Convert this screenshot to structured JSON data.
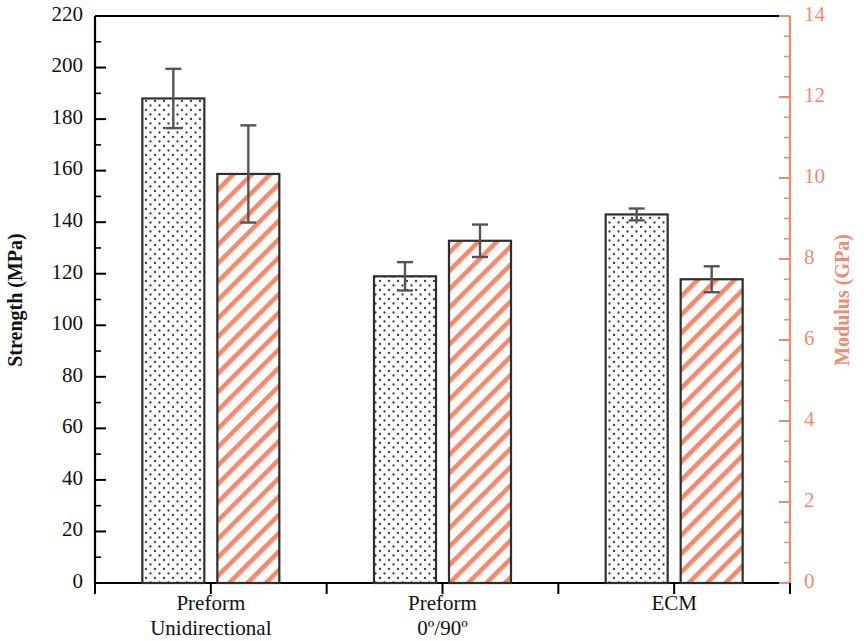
{
  "chart_data": {
    "type": "bar",
    "title": "",
    "subtitle": "",
    "categories": [
      "Preform Unidirectional",
      "Preform 0º/90º",
      "ECM"
    ],
    "category_lines": [
      [
        "Preform",
        "Unidirectional"
      ],
      [
        "Preform",
        "0º/90º"
      ],
      [
        "ECM",
        ""
      ]
    ],
    "series": [
      {
        "name": "Strength (MPa)",
        "axis": "left",
        "pattern": "dotted",
        "values": [
          188,
          119,
          143
        ],
        "errors": [
          11.5,
          5.5,
          2.3
        ],
        "color": "#000000",
        "fill": "#ffffff"
      },
      {
        "name": "Modulus (GPa)",
        "axis": "right",
        "pattern": "diagonal-hatch",
        "values": [
          10.1,
          8.45,
          7.5
        ],
        "errors": [
          1.2,
          0.4,
          0.32
        ],
        "color": "#ef8b70",
        "fill": "#fffaf6"
      }
    ],
    "left_axis": {
      "label": "Strength (MPa)",
      "ticks": [
        0,
        20,
        40,
        60,
        80,
        100,
        120,
        140,
        160,
        180,
        200,
        220
      ],
      "tick_labels": [
        "0",
        "20",
        "40",
        "60",
        "80",
        "100",
        "120",
        "140",
        "160",
        "180",
        "200",
        "220"
      ],
      "ylim": [
        0,
        220
      ],
      "minor_ticks_per_major": 2,
      "color": "#000000"
    },
    "right_axis": {
      "label": "Modulus (GPa)",
      "ticks": [
        0,
        2,
        4,
        6,
        8,
        10,
        12,
        14
      ],
      "tick_labels": [
        "0",
        "2",
        "4",
        "6",
        "8",
        "10",
        "12",
        "14"
      ],
      "ylim": [
        0,
        14
      ],
      "minor_ticks_per_major": 4,
      "color": "#ef8b70"
    },
    "xlabel": "",
    "grid": false,
    "legend": "none",
    "legend_position": "none",
    "accent_color": "#ef8b70",
    "frame_color": "#000000",
    "background": "#ffffff"
  },
  "axes": {
    "left_title": "Strength (MPa)",
    "right_title": "Modulus (GPa)"
  }
}
